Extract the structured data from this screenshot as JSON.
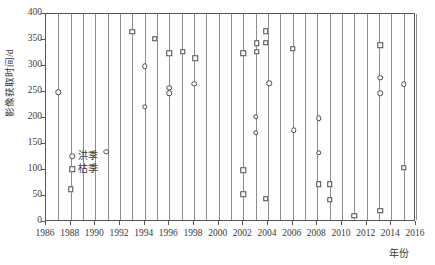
{
  "chart_data": {
    "type": "scatter",
    "title": "",
    "xlabel": "年份",
    "ylabel": "影像获取时间/d",
    "xlim": [
      1986,
      2016
    ],
    "ylim": [
      0,
      400
    ],
    "xticks": [
      1986,
      1988,
      1990,
      1992,
      1994,
      1996,
      1998,
      2000,
      2002,
      2004,
      2006,
      2008,
      2010,
      2012,
      2014,
      2016
    ],
    "yticks": [
      0,
      50,
      100,
      150,
      200,
      250,
      300,
      350,
      400
    ],
    "grid": "vertical-only",
    "legend_position": "inside-lower-left",
    "series": [
      {
        "name": "洪季",
        "marker": "circle",
        "points": [
          {
            "x": 1987.0,
            "y": 250
          },
          {
            "x": 1990.9,
            "y": 135
          },
          {
            "x": 1994.0,
            "y": 300
          },
          {
            "x": 1994.0,
            "y": 222
          },
          {
            "x": 1996.0,
            "y": 258
          },
          {
            "x": 1996.0,
            "y": 248
          },
          {
            "x": 1998.0,
            "y": 266
          },
          {
            "x": 2003.0,
            "y": 202
          },
          {
            "x": 2003.0,
            "y": 172
          },
          {
            "x": 2004.1,
            "y": 267
          },
          {
            "x": 2006.1,
            "y": 176
          },
          {
            "x": 2008.1,
            "y": 200
          },
          {
            "x": 2008.1,
            "y": 133
          },
          {
            "x": 2013.1,
            "y": 277
          },
          {
            "x": 2013.1,
            "y": 248
          },
          {
            "x": 2015.0,
            "y": 265
          }
        ]
      },
      {
        "name": "枯季",
        "marker": "square",
        "points": [
          {
            "x": 1988.0,
            "y": 63
          },
          {
            "x": 1993.0,
            "y": 366
          },
          {
            "x": 1994.8,
            "y": 352
          },
          {
            "x": 1996.0,
            "y": 325
          },
          {
            "x": 1997.1,
            "y": 327
          },
          {
            "x": 1998.1,
            "y": 315
          },
          {
            "x": 2002.0,
            "y": 325
          },
          {
            "x": 2002.0,
            "y": 100
          },
          {
            "x": 2002.0,
            "y": 53
          },
          {
            "x": 2003.1,
            "y": 344
          },
          {
            "x": 2003.1,
            "y": 327
          },
          {
            "x": 2003.8,
            "y": 367
          },
          {
            "x": 2003.8,
            "y": 345
          },
          {
            "x": 2003.8,
            "y": 45
          },
          {
            "x": 2006.0,
            "y": 333
          },
          {
            "x": 2008.1,
            "y": 73
          },
          {
            "x": 2009.0,
            "y": 73
          },
          {
            "x": 2009.0,
            "y": 43
          },
          {
            "x": 2011.0,
            "y": 12
          },
          {
            "x": 2013.1,
            "y": 340
          },
          {
            "x": 2013.1,
            "y": 22
          },
          {
            "x": 2015.0,
            "y": 104
          }
        ]
      }
    ]
  }
}
